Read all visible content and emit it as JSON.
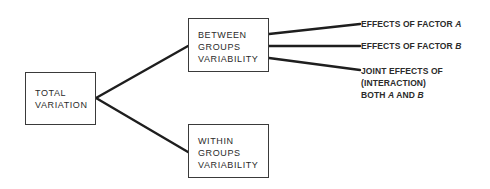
{
  "diagram": {
    "root": {
      "lines": [
        "TOTAL",
        "VARIATION"
      ]
    },
    "between": {
      "lines": [
        "BETWEEN",
        "GROUPS",
        "VARIABILITY"
      ]
    },
    "within": {
      "lines": [
        "WITHIN",
        "GROUPS",
        "VARIABILITY"
      ]
    },
    "effects": {
      "factor_a": {
        "prefix": "EFFECTS OF FACTOR ",
        "var": "A"
      },
      "factor_b": {
        "prefix": "EFFECTS OF FACTOR ",
        "var": "B"
      },
      "interaction": {
        "line1": "JOINT EFFECTS OF",
        "line2": "(INTERACTION)",
        "line3_prefix": "BOTH ",
        "line3_a": "A",
        "line3_mid": " AND ",
        "line3_b": "B"
      }
    },
    "colors": {
      "line": "#1e1e1e",
      "border": "#3a3a3a",
      "text": "#2a2a2a"
    }
  }
}
